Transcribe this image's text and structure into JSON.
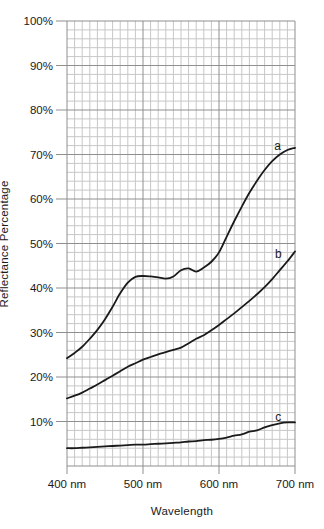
{
  "page": {
    "background": "#ffffff"
  },
  "chart_data": {
    "type": "line",
    "title": "",
    "xlabel": "Wavelength",
    "ylabel": "Reflectance Percentage",
    "x_unit": "nm",
    "y_unit": "%",
    "xlim": [
      400,
      700
    ],
    "ylim": [
      0,
      100
    ],
    "grid": {
      "shown": true,
      "minor_x_step_nm": 10,
      "minor_y_step_pct": 2,
      "major_x_step_nm": 100,
      "major_y_step_pct": 10,
      "minor_color": "#c7c7c7",
      "major_color": "#8f8f8f"
    },
    "axis_color": "#1a1a1a",
    "curve_color": "#1a1a1a",
    "x_ticks": [
      {
        "value": 400,
        "label": "400 nm"
      },
      {
        "value": 500,
        "label": "500 nm"
      },
      {
        "value": 600,
        "label": "600 nm"
      },
      {
        "value": 700,
        "label": "700 nm"
      }
    ],
    "y_ticks": [
      {
        "value": 10,
        "label": "10%"
      },
      {
        "value": 20,
        "label": "20%"
      },
      {
        "value": 30,
        "label": "30%"
      },
      {
        "value": 40,
        "label": "40%"
      },
      {
        "value": 50,
        "label": "50%"
      },
      {
        "value": 60,
        "label": "60%"
      },
      {
        "value": 70,
        "label": "70%"
      },
      {
        "value": 80,
        "label": "80%"
      },
      {
        "value": 90,
        "label": "90%"
      },
      {
        "value": 100,
        "label": "100%"
      }
    ],
    "x": [
      400,
      410,
      420,
      430,
      440,
      450,
      460,
      470,
      480,
      490,
      500,
      510,
      520,
      530,
      540,
      550,
      560,
      570,
      580,
      590,
      600,
      610,
      620,
      630,
      640,
      650,
      660,
      670,
      680,
      690,
      700
    ],
    "series": [
      {
        "name": "a",
        "label": "a",
        "values": [
          24.2,
          25.4,
          26.8,
          28.6,
          30.6,
          33.0,
          35.8,
          38.8,
          41.2,
          42.5,
          42.7,
          42.6,
          42.4,
          42.1,
          42.6,
          44.0,
          44.4,
          43.7,
          44.6,
          45.9,
          48.0,
          51.5,
          55.0,
          58.3,
          61.4,
          64.1,
          66.5,
          68.5,
          70.0,
          71.0,
          71.5
        ],
        "label_pos": {
          "x": 677,
          "y": 71.9
        }
      },
      {
        "name": "b",
        "label": "b",
        "values": [
          15.2,
          15.8,
          16.5,
          17.4,
          18.3,
          19.3,
          20.3,
          21.3,
          22.3,
          23.1,
          23.9,
          24.5,
          25.1,
          25.6,
          26.1,
          26.6,
          27.6,
          28.6,
          29.4,
          30.5,
          31.7,
          33.0,
          34.3,
          35.7,
          37.1,
          38.6,
          40.2,
          42.0,
          44.0,
          46.0,
          48.2
        ],
        "label_pos": {
          "x": 678,
          "y": 47.7
        }
      },
      {
        "name": "c",
        "label": "c",
        "values": [
          4.0,
          4.0,
          4.1,
          4.2,
          4.3,
          4.4,
          4.5,
          4.6,
          4.7,
          4.8,
          4.8,
          4.9,
          5.0,
          5.1,
          5.2,
          5.3,
          5.5,
          5.6,
          5.8,
          5.9,
          6.1,
          6.4,
          6.8,
          7.1,
          7.7,
          8.0,
          8.7,
          9.2,
          9.6,
          9.8,
          9.8
        ],
        "label_pos": {
          "x": 678,
          "y": 10.9
        }
      }
    ]
  }
}
